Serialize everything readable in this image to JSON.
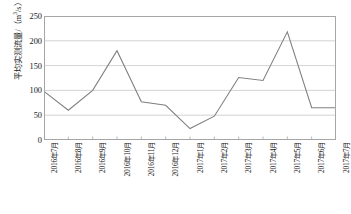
{
  "chart_data": {
    "type": "line",
    "title": "",
    "xlabel": "",
    "ylabel": "平均实测流量/（m³/s）",
    "ylabel_main": "平均实测流量/（m",
    "ylabel_sup": "3",
    "ylabel_tail": "/s）",
    "categories": [
      "2016年7月",
      "2016年8月",
      "2016年9月",
      "2016年10月",
      "2016年11月",
      "2016年12月",
      "2017年1月",
      "2017年2月",
      "2017年3月",
      "2017年4月",
      "2017年5月",
      "2017年6月",
      "2017年7月"
    ],
    "values": [
      98,
      60,
      100,
      180,
      77,
      70,
      23,
      48,
      126,
      120,
      218,
      65,
      65
    ],
    "ylim": [
      0,
      250
    ],
    "yticks": [
      0,
      50,
      100,
      150,
      200,
      250
    ],
    "ytick_labels": [
      "0",
      "50",
      "100",
      "150",
      "200",
      "250"
    ],
    "grid": true,
    "grid_axis": "y",
    "legend": "none",
    "series_color": "#808080",
    "grid_color": "#c8c8c8",
    "frame_color": "#a6a6a6"
  }
}
